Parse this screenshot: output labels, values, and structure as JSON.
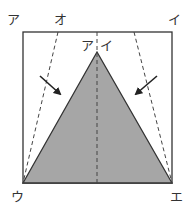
{
  "diagram": {
    "labels": {
      "top_left": "ア",
      "top_o": "オ",
      "top_right": "イ",
      "apex_a": "ア",
      "apex_i": "イ",
      "bottom_left": "ウ",
      "bottom_right": "エ"
    },
    "colors": {
      "triangle_fill": "#a6a6a6",
      "stroke": "#333333",
      "background": "#ffffff"
    },
    "shapes": {
      "square": {
        "x": 23,
        "y": 32,
        "w": 149,
        "h": 151
      },
      "triangle": [
        [
          97,
          52
        ],
        [
          23,
          183
        ],
        [
          172,
          183
        ]
      ],
      "dashed_lines": [
        [
          [
            58,
            32
          ],
          [
            23,
            183
          ]
        ],
        [
          [
            97,
            32
          ],
          [
            97,
            183
          ]
        ],
        [
          [
            134,
            32
          ],
          [
            172,
            183
          ]
        ]
      ],
      "arrows": [
        {
          "from": [
            40,
            76
          ],
          "to": [
            60,
            93
          ]
        },
        {
          "from": [
            157,
            76
          ],
          "to": [
            136,
            93
          ]
        }
      ]
    }
  }
}
